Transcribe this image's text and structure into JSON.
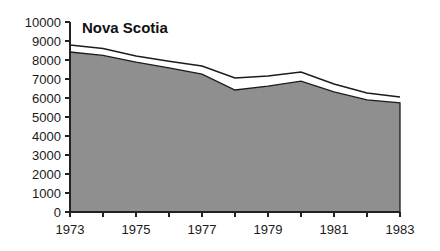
{
  "chart_data": {
    "type": "area",
    "title": "Nova Scotia",
    "xlabel": "",
    "ylabel": "",
    "grid": false,
    "legend": "none",
    "xlim": [
      1973,
      1983
    ],
    "ylim": [
      0,
      10000
    ],
    "x": [
      1973,
      1974,
      1975,
      1976,
      1977,
      1978,
      1979,
      1980,
      1981,
      1982,
      1983
    ],
    "xticks": [
      1973,
      1975,
      1977,
      1979,
      1981,
      1983
    ],
    "xtick_labels": [
      "1973",
      "1975",
      "1977",
      "1979",
      "1981",
      "1983"
    ],
    "yticks": [
      0,
      1000,
      2000,
      3000,
      4000,
      5000,
      6000,
      7000,
      8000,
      9000,
      10000
    ],
    "ytick_labels": [
      "0",
      "1000",
      "2000",
      "3000",
      "4000",
      "5000",
      "6000",
      "7000",
      "8000",
      "9000",
      "10000"
    ],
    "series": [
      {
        "name": "Total",
        "values": [
          8790,
          8600,
          8210,
          7940,
          7680,
          7050,
          7160,
          7370,
          6740,
          6260,
          6050
        ]
      },
      {
        "name": "Shaded",
        "values": [
          8420,
          8240,
          7890,
          7580,
          7260,
          6420,
          6630,
          6890,
          6320,
          5900,
          5740
        ]
      }
    ],
    "colors": {
      "fill": "#8f8f8f",
      "band": "#ffffff",
      "stroke": "#1c1c1c",
      "axis": "#222222",
      "text": "#1a1a1a"
    }
  },
  "geometry": {
    "plot_left": 70,
    "plot_right": 400,
    "plot_top": 22,
    "plot_bottom": 212,
    "title_x": 82,
    "title_y": 33
  }
}
